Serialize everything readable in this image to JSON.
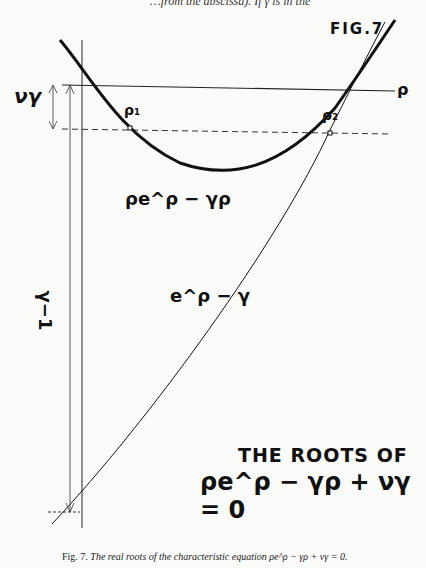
{
  "header": {
    "cut_off_text": "…from the abscissa). If γ is in the"
  },
  "figure": {
    "label": "FIG.7",
    "title_line1": "THE ROOTS OF",
    "title_line2": "ρe^ρ − γρ + νγ = 0",
    "axis_label_rho": "ρ",
    "root_labels": [
      "ρ₁",
      "ρ₂"
    ],
    "curve_labels": {
      "curve_1": "ρe^ρ − γρ",
      "curve_2": "e^ρ − γ"
    },
    "dimension_labels": {
      "nu_gamma": "νγ",
      "gamma_minus_1": "γ−1"
    }
  },
  "caption": {
    "prefix": "Fig. 7.",
    "text": "The real roots of the characteristic equation",
    "equation": "ρe^ρ − γρ + νγ = 0."
  }
}
